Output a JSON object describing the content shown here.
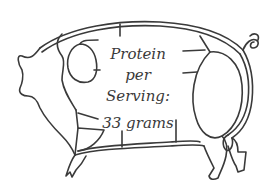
{
  "diagram": {
    "stroke_color": "#3a3a3a",
    "background_color": "#ffffff",
    "label": {
      "line1": "Protein",
      "line2": "per",
      "line3": "Serving:",
      "value": "33 grams"
    }
  }
}
